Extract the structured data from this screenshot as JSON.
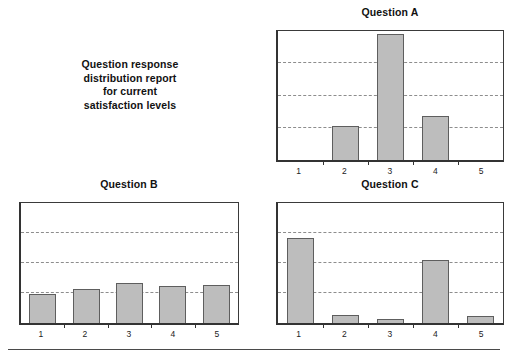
{
  "report": {
    "caption_lines": [
      "Question response",
      "distribution report",
      "for current",
      "satisfaction levels"
    ]
  },
  "colors": {
    "bar_fill": "#bdbdbd",
    "bar_outline": "#5e5e5e",
    "axis": "#333333",
    "gridline": "#8d8d8d",
    "text": "#111111",
    "background": "#ffffff",
    "footer_rule": "#4a4a4a"
  },
  "chart_data": [
    {
      "id": "question-a",
      "type": "bar",
      "title": "Question A",
      "categories": [
        "1",
        "2",
        "3",
        "4",
        "5"
      ],
      "values": [
        0,
        1.05,
        3.9,
        1.35,
        0
      ],
      "xlabel": "",
      "ylabel": "",
      "ylim": [
        0,
        4
      ],
      "gridlines": [
        1,
        2,
        3
      ],
      "grid": true,
      "ytick_labels": [],
      "legend": null
    },
    {
      "id": "question-b",
      "type": "bar",
      "title": "Question B",
      "categories": [
        "1",
        "2",
        "3",
        "4",
        "5"
      ],
      "values": [
        0.97,
        1.13,
        1.32,
        1.22,
        1.27
      ],
      "xlabel": "",
      "ylabel": "",
      "ylim": [
        0,
        4
      ],
      "gridlines": [
        1,
        2,
        3
      ],
      "grid": true,
      "ytick_labels": [],
      "legend": null
    },
    {
      "id": "question-c",
      "type": "bar",
      "title": "Question C",
      "categories": [
        "1",
        "2",
        "3",
        "4",
        "5"
      ],
      "values": [
        2.85,
        0.26,
        0.15,
        2.1,
        0.22
      ],
      "xlabel": "",
      "ylabel": "",
      "ylim": [
        0,
        4
      ],
      "gridlines": [
        1,
        2,
        3
      ],
      "grid": true,
      "ytick_labels": [],
      "legend": null
    }
  ]
}
